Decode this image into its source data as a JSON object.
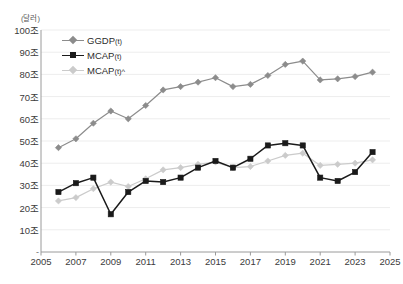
{
  "chart_data": {
    "type": "line",
    "title": "",
    "unit_label": "(달러)",
    "xlabel": "",
    "ylabel": "",
    "x": [
      2006,
      2007,
      2008,
      2009,
      2010,
      2011,
      2012,
      2013,
      2014,
      2015,
      2016,
      2017,
      2018,
      2019,
      2020,
      2021,
      2022,
      2023,
      2024
    ],
    "xlim": [
      2005,
      2025
    ],
    "ylim": [
      0,
      100
    ],
    "y_ticks": [
      "-",
      "10조",
      "20조",
      "30조",
      "40조",
      "50조",
      "60조",
      "70조",
      "80조",
      "90조",
      "100조"
    ],
    "y_tick_values": [
      0,
      10,
      20,
      30,
      40,
      50,
      60,
      70,
      80,
      90,
      100
    ],
    "x_ticks": [
      "2005",
      "2007",
      "2009",
      "2011",
      "2013",
      "2015",
      "2017",
      "2019",
      "2021",
      "2023",
      "2025"
    ],
    "x_tick_values": [
      2005,
      2007,
      2009,
      2011,
      2013,
      2015,
      2017,
      2019,
      2021,
      2023,
      2025
    ],
    "grid": true,
    "legend_position": "top-left",
    "series": [
      {
        "name": "GGDP(t)",
        "label_main": "GGDP",
        "label_sub": "(t)",
        "color": "#8c8c8c",
        "marker": "diamond",
        "values": [
          47.0,
          51.0,
          58.0,
          63.5,
          60.0,
          66.0,
          73.0,
          74.5,
          76.5,
          78.5,
          74.5,
          75.5,
          79.5,
          84.5,
          86.0,
          77.5,
          78.0,
          79.0,
          81.0
        ]
      },
      {
        "name": "MCAP(t)",
        "label_main": "MCAP",
        "label_sub": "(t)",
        "color": "#1a1a1a",
        "marker": "square",
        "values": [
          27.0,
          31.0,
          33.5,
          17.0,
          27.0,
          32.0,
          31.5,
          33.5,
          38.0,
          41.0,
          38.0,
          42.0,
          48.0,
          49.0,
          48.0,
          33.5,
          32.0,
          36.0,
          45.0
        ]
      },
      {
        "name": "MCAP(t)^",
        "label_main": "MCAP",
        "label_sub": "(t)^",
        "color": "#cbcbcb",
        "marker": "diamond",
        "values": [
          23.0,
          24.5,
          28.5,
          31.5,
          29.5,
          33.0,
          37.0,
          38.0,
          39.5,
          40.5,
          38.0,
          38.5,
          41.0,
          43.5,
          44.5,
          39.0,
          39.5,
          40.0,
          41.5
        ]
      }
    ]
  }
}
